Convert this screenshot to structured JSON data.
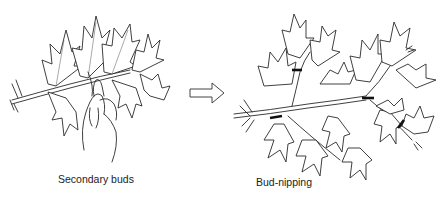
{
  "figure": {
    "left_panel": {
      "caption": "Secondary buds",
      "description": "Branch with maple-like leaves; hand pinching secondary bud"
    },
    "arrow": {
      "direction": "right",
      "icon": "hollow-arrow-icon"
    },
    "right_panel": {
      "caption": "Bud-nipping",
      "description": "Branched shoot with multiple cut marks indicating bud-nipping points",
      "cut_marks": 5
    },
    "colors": {
      "ink": "#2a2a2a",
      "background": "#ffffff"
    }
  }
}
